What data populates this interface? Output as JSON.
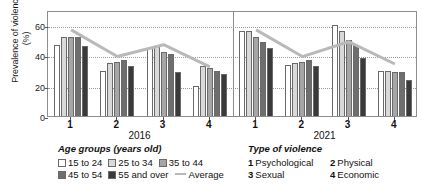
{
  "axis": {
    "y_title": "Prevalence of violence (%)",
    "y_ticks": [
      "0",
      "20",
      "40",
      "60"
    ]
  },
  "panels": [
    {
      "year": "2016",
      "x_ticks": [
        "1",
        "2",
        "3",
        "4"
      ]
    },
    {
      "year": "2021",
      "x_ticks": [
        "1",
        "2",
        "3",
        "4"
      ]
    }
  ],
  "legend_age": {
    "title": "Age groups (years old)",
    "items": [
      {
        "label": "15 to 24",
        "color": "#ffffff"
      },
      {
        "label": "25 to 34",
        "color": "#d9d9d9"
      },
      {
        "label": "35 to 44",
        "color": "#a6a6a6"
      },
      {
        "label": "45 to 54",
        "color": "#6e6e6e"
      },
      {
        "label": "55 and over",
        "color": "#3a3a3a"
      }
    ],
    "average_label": "Average",
    "average_color": "#b9b9b9"
  },
  "legend_type": {
    "title": "Type of violence",
    "items": [
      {
        "num": "1",
        "label": "Psychological"
      },
      {
        "num": "2",
        "label": "Physical"
      },
      {
        "num": "3",
        "label": "Sexual"
      },
      {
        "num": "4",
        "label": "Economic"
      }
    ]
  },
  "chart_data": {
    "type": "bar",
    "title": "",
    "xlabel": "Type of violence",
    "ylabel": "Prevalence of violence (%)",
    "ylim": [
      0,
      70
    ],
    "grid": true,
    "legend_position": "bottom",
    "categories": [
      "1",
      "2",
      "3",
      "4"
    ],
    "category_names": [
      "Psychological",
      "Physical",
      "Sexual",
      "Economic"
    ],
    "panels": [
      {
        "name": "2016",
        "series": [
          {
            "name": "15 to 24",
            "values": [
              47,
              30,
              45,
              20
            ]
          },
          {
            "name": "25 to 34",
            "values": [
              52,
              35,
              46,
              33
            ]
          },
          {
            "name": "35 to 44",
            "values": [
              52,
              36,
              42,
              32
            ]
          },
          {
            "name": "45 to 54",
            "values": [
              52,
              37,
              41,
              30
            ]
          },
          {
            "name": "55 and over",
            "values": [
              46,
              33,
              29,
              28
            ]
          }
        ],
        "average": {
          "name": "Average",
          "values": [
            58,
            40,
            48,
            33
          ]
        }
      },
      {
        "name": "2021",
        "series": [
          {
            "name": "15 to 24",
            "values": [
              56,
              34,
              60,
              30
            ]
          },
          {
            "name": "25 to 34",
            "values": [
              56,
              35,
              56,
              30
            ]
          },
          {
            "name": "35 to 44",
            "values": [
              52,
              36,
              50,
              29
            ]
          },
          {
            "name": "45 to 54",
            "values": [
              49,
              37,
              47,
              29
            ]
          },
          {
            "name": "55 and over",
            "values": [
              45,
              33,
              38,
              24
            ]
          }
        ],
        "average": {
          "name": "Average",
          "values": [
            58,
            40,
            50,
            35
          ]
        }
      }
    ]
  }
}
